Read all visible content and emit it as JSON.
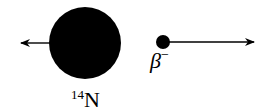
{
  "diagram": {
    "nucleus": {
      "label_mass": "14",
      "label_symbol": "N",
      "color": "#000000"
    },
    "particle": {
      "label_symbol": "β",
      "label_charge": "−",
      "color": "#000000"
    },
    "arrows": [
      {
        "from": "nucleus",
        "direction": "left"
      },
      {
        "from": "particle",
        "direction": "right"
      }
    ]
  }
}
